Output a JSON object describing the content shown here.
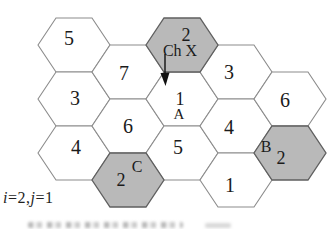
{
  "figure": {
    "corner_label": "i=2,j=1",
    "corner_label_parts": [
      {
        "text": "i",
        "italic": true
      },
      {
        "text": "=2,",
        "italic": false
      },
      {
        "text": "j",
        "italic": true
      },
      {
        "text": "=1",
        "italic": false
      }
    ],
    "colors": {
      "background": "#ffffff",
      "cell_fill": "#ffffff",
      "shaded_fill": "#b9b9b9",
      "cell_stroke": "#8c8c8c",
      "shaded_stroke": "#5f5f5f",
      "text": "#1b1b1b",
      "arrow": "#111111"
    },
    "cells": [
      {
        "name": "cell-5-upper-left",
        "number": "5",
        "col": 0,
        "row": 0,
        "shaded": false,
        "ndx": -5,
        "ndy": 0
      },
      {
        "name": "cell-3-left",
        "number": "3",
        "col": 0,
        "row": 1,
        "shaded": false,
        "ndx": 1,
        "ndy": 6
      },
      {
        "name": "cell-4-left",
        "number": "4",
        "col": 0,
        "row": 2,
        "shaded": false,
        "ndx": 2,
        "ndy": 1
      },
      {
        "name": "cell-7",
        "number": "7",
        "col": 1,
        "row": 0,
        "shaded": false,
        "ndx": -4,
        "ndy": 8
      },
      {
        "name": "cell-6-center",
        "number": "6",
        "col": 1,
        "row": 1,
        "shaded": false,
        "ndx": 0,
        "ndy": 7
      },
      {
        "name": "cell-2-cochannel-C",
        "number": "2",
        "col": 1,
        "row": 2,
        "shaded": true,
        "tag": "C",
        "variant": "c"
      },
      {
        "name": "cell-2-channel-X",
        "number": "2",
        "col": 2,
        "row": 0,
        "shaded": true,
        "tag": "Ch X",
        "variant": "chx",
        "has_arrow": true
      },
      {
        "name": "cell-1-A",
        "number": "1",
        "col": 2,
        "row": 1,
        "shaded": false,
        "tag": "A",
        "variant": "a"
      },
      {
        "name": "cell-5-lower",
        "number": "5",
        "col": 2,
        "row": 2,
        "shaded": false,
        "ndx": -4,
        "ndy": 1
      },
      {
        "name": "cell-3-upper-right",
        "number": "3",
        "col": 3,
        "row": 0,
        "shaded": false,
        "ndx": -7,
        "ndy": 7
      },
      {
        "name": "cell-4-right",
        "number": "4",
        "col": 3,
        "row": 1,
        "shaded": false,
        "ndx": -7,
        "ndy": 8
      },
      {
        "name": "cell-1-lower-right",
        "number": "1",
        "col": 3,
        "row": 2,
        "shaded": false,
        "ndx": -6,
        "ndy": 12
      },
      {
        "name": "cell-6-far-right",
        "number": "6",
        "col": 4,
        "row": 1,
        "shaded": false,
        "ndx": -5,
        "ndy": 8
      },
      {
        "name": "cell-2-cochannel-B",
        "number": "2",
        "col": 4,
        "row": 2,
        "shaded": true,
        "tag": "B",
        "variant": "b"
      }
    ]
  }
}
